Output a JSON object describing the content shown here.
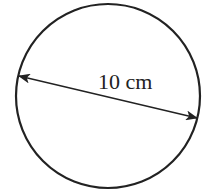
{
  "diagram": {
    "shape": "circle",
    "dimension_label": "10 cm",
    "dimension_type": "diameter",
    "colors": {
      "stroke": "#222222",
      "background": "#ffffff"
    }
  }
}
